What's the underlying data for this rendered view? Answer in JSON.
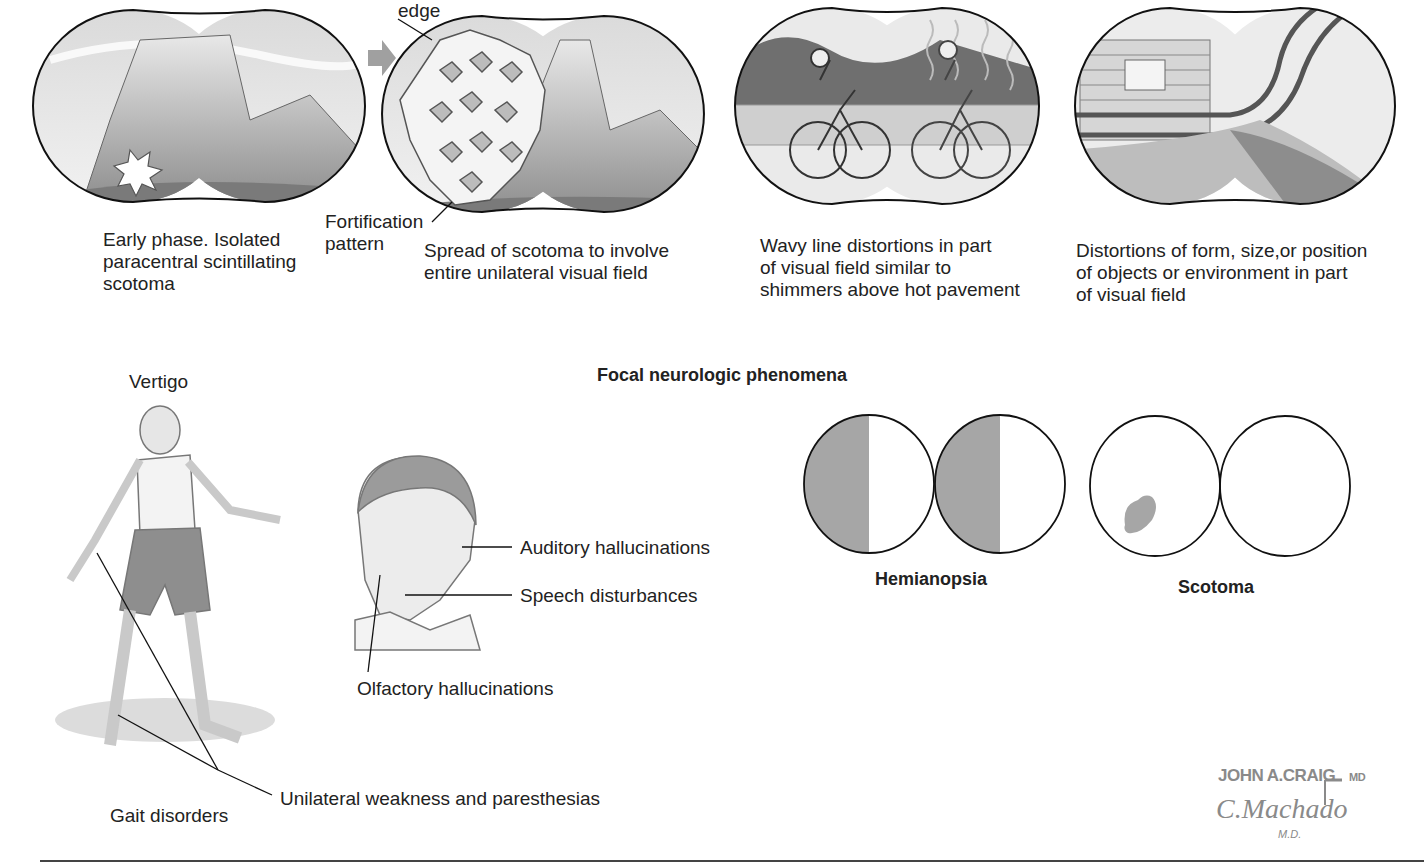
{
  "top_panels": [
    {
      "id": "early-phase",
      "caption": "Early phase. Isolated\nparacentral scintillating\nscotoma"
    },
    {
      "id": "spread",
      "caption": "Spread of scotoma to involve\nentire unilateral visual field",
      "labels": {
        "edge": "edge",
        "fortification": "Fortification\npattern"
      }
    },
    {
      "id": "wavy",
      "caption": "Wavy line distortions in part\nof visual field similar to\nshimmers above hot pavement"
    },
    {
      "id": "distortions",
      "caption": "Distortions of form, size,or position\nof objects or environment in part\nof visual field"
    }
  ],
  "section_title": "Focal neurologic phenomena",
  "figure_labels": {
    "vertigo": "Vertigo",
    "gait": "Gait disorders",
    "weakness": "Unilateral weakness and paresthesias",
    "auditory": "Auditory hallucinations",
    "speech": "Speech disturbances",
    "olfactory": "Olfactory hallucinations"
  },
  "visual_fields": {
    "hemianopsia": "Hemianopsia",
    "scotoma": "Scotoma",
    "fill_color": "#a6a6a6"
  },
  "signature": {
    "line1": "JOHN A.CRAIG",
    "line1_suffix": "MD",
    "line2": "C.Machado",
    "line3": "M.D."
  }
}
